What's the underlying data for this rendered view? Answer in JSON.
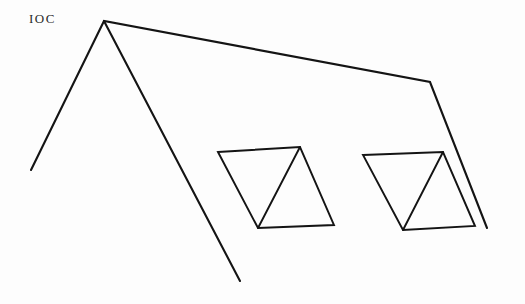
{
  "figure": {
    "label": "IOC",
    "background_color": "#fdfdfd",
    "stroke_color": "#141414",
    "canvas": {
      "width": 525,
      "height": 304
    },
    "shapes": {
      "tent_polyline": {
        "name": "tent-outline",
        "points": "31,170 104,21 430,82 487,228"
      },
      "tent_inner_leg": {
        "name": "tent-inner-leg",
        "points": "104,21 240,281"
      },
      "left_parallelogram": {
        "name": "left-parallelogram",
        "points": "218,152 300,147 334,225 258,228"
      },
      "left_triangle_leg_a": {
        "name": "left-triangle-left-edge",
        "points": "300,147 258,228"
      },
      "right_parallelogram": {
        "name": "right-parallelogram",
        "points": "363,155 443,152 475,226 403,230"
      },
      "right_triangle_leg_a": {
        "name": "right-triangle-left-edge",
        "points": "443,152 403,230"
      }
    }
  }
}
